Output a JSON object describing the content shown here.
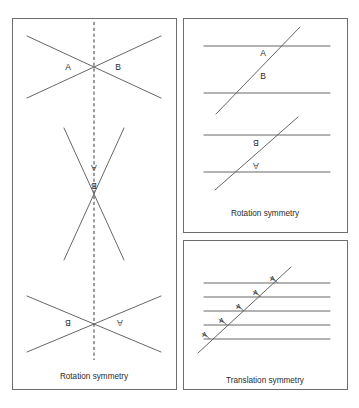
{
  "figure": {
    "background_color": "#ffffff",
    "line_color": "#555555",
    "frame_color": "#6d6d6d",
    "text_color": "#2b2b2b"
  },
  "panels": {
    "left": {
      "name": "left-panel",
      "caption": "Rotation symmetry",
      "mirror_line": {
        "label": "dashed vertical mirror line",
        "x": 94,
        "y1": 22,
        "y2": 360
      },
      "figures": [
        {
          "name": "x-crossing-top",
          "orientation": "upright",
          "labels": [
            {
              "text": "A",
              "x": 68,
              "y": 70,
              "flipped": false
            },
            {
              "text": "B",
              "x": 118,
              "y": 70,
              "flipped": false
            }
          ]
        },
        {
          "name": "x-crossing-middle",
          "orientation": "rotated-180",
          "labels": [
            {
              "text": "A",
              "x": 94,
              "y": 171,
              "flipped": true
            },
            {
              "text": "B",
              "x": 94,
              "y": 189,
              "flipped": true
            }
          ]
        },
        {
          "name": "x-crossing-bottom",
          "orientation": "rotated-180",
          "labels": [
            {
              "text": "B",
              "x": 68,
              "y": 326,
              "flipped": true
            },
            {
              "text": "A",
              "x": 120,
              "y": 326,
              "flipped": true
            }
          ]
        }
      ]
    },
    "top_right": {
      "name": "top-right-panel",
      "caption": "Rotation symmetry",
      "figures": [
        {
          "name": "transversal-upright",
          "orientation": "upright",
          "parallel_lines": 2,
          "labels": [
            {
              "text": "A",
              "x": 263,
              "y": 53,
              "flipped": false
            },
            {
              "text": "B",
              "x": 263,
              "y": 76,
              "flipped": false
            }
          ]
        },
        {
          "name": "transversal-rotated",
          "orientation": "rotated-180",
          "parallel_lines": 2,
          "labels": [
            {
              "text": "B",
              "x": 256,
              "y": 143,
              "flipped": true
            },
            {
              "text": "A",
              "x": 256,
              "y": 166,
              "flipped": true
            }
          ]
        }
      ]
    },
    "bottom_right": {
      "name": "bottom-right-panel",
      "caption": "Translation symmetry",
      "figure": {
        "name": "transversal-five-parallels",
        "parallel_lines": 5,
        "angle_marks": [
          {
            "text": "A",
            "x": 272,
            "y": 286
          },
          {
            "text": "A",
            "x": 255,
            "y": 300
          },
          {
            "text": "A",
            "x": 238,
            "y": 314
          },
          {
            "text": "A",
            "x": 221,
            "y": 328
          },
          {
            "text": "A",
            "x": 204,
            "y": 342
          }
        ]
      }
    }
  }
}
